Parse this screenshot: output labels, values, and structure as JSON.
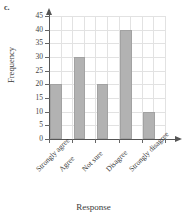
{
  "figure": {
    "part_label": "c."
  },
  "chart_data": {
    "type": "bar",
    "title": "",
    "xlabel": "Response",
    "ylabel": "Frequency",
    "categories": [
      "Strongly agree",
      "Agree",
      "Not sure",
      "Disagree",
      "Strongly disagree"
    ],
    "values": [
      20,
      30,
      20,
      40,
      10
    ],
    "ylim": [
      0,
      45
    ],
    "ytick_labels": [
      "0",
      "5",
      "10",
      "15",
      "20",
      "25",
      "30",
      "35",
      "40",
      "45"
    ],
    "ytick_values": [
      0,
      5,
      10,
      15,
      20,
      25,
      30,
      35,
      40,
      45
    ],
    "grid": true,
    "legend": "none",
    "bar_color": "#b2b2b2",
    "bar_edge_color": "#a2a2a2",
    "grid_color": "#e2e2e2",
    "axis_color": "#555555"
  }
}
